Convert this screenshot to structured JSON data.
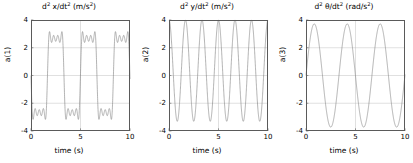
{
  "figure": {
    "background": "#ffffff",
    "line_color": "#808080",
    "grid_color": "#b9b9b9",
    "axis_color": "#5a5a5a"
  },
  "chart_data": [
    {
      "type": "line",
      "index": 0,
      "title": "d² x/dt² (m/s²)",
      "title_parts": {
        "d": "d",
        "sup1": "2",
        "mid": " x/dt",
        "sup2": "2",
        "units": " (m/s",
        "sup3": "2",
        "close": ")"
      },
      "xlabel": "time (s)",
      "ylabel": "a(1)",
      "xlim": [
        0,
        10
      ],
      "ylim": [
        -4,
        4
      ],
      "xticks": [
        0,
        5,
        10
      ],
      "xticklabels": [
        "0",
        "5",
        "10"
      ],
      "yticks": [
        -4,
        -2,
        0,
        2,
        4
      ],
      "yticklabels": [
        "-4",
        "-2",
        "0",
        "2",
        "4"
      ],
      "grid": true,
      "gridlines_y": [
        -2,
        0,
        2
      ],
      "gridlines_x": [
        5
      ],
      "legend": null,
      "waveform": "square_with_ripple",
      "description": "Square-wave-like acceleration with three ripple humps on each plateau",
      "fundamental_period_s": 3.33,
      "plateau_level": 2.75,
      "ripple_peak": 3.4,
      "harmonics": [
        {
          "n": 1,
          "amplitude": 3.4
        },
        {
          "n": 3,
          "amplitude": 1.1333
        },
        {
          "n": 5,
          "amplitude": 0.68
        },
        {
          "n": 7,
          "amplitude": 0.4857
        }
      ],
      "phase_rad": 0.0,
      "start_value": -2.1
    },
    {
      "type": "line",
      "index": 1,
      "title": "d² y/dt² (m/s²)",
      "title_parts": {
        "d": "d",
        "sup1": "2",
        "mid": " y/dt",
        "sup2": "2",
        "units": " (m/s",
        "sup3": "2",
        "close": ")"
      },
      "xlabel": "time (s)",
      "ylabel": "a(2)",
      "xlim": [
        0,
        10
      ],
      "ylim": [
        -4,
        4
      ],
      "xticks": [
        0,
        5,
        10
      ],
      "xticklabels": [
        "0",
        "5",
        "10"
      ],
      "yticks": [
        -4,
        -2,
        0,
        2,
        4
      ],
      "yticklabels": [
        "-4",
        "-2",
        "0",
        "2",
        "4"
      ],
      "grid": true,
      "gridlines_y": [
        -2,
        0,
        2
      ],
      "gridlines_x": [
        5
      ],
      "legend": null,
      "waveform": "sinusoid",
      "description": "Sinusoidal acceleration, about six cycles over ten seconds, offset upward",
      "period_s": 1.667,
      "amplitude": 3.65,
      "offset": 0.35,
      "peak": 4.0,
      "trough": -3.3,
      "phase_rad": 1.5708,
      "start_value": 3.9
    },
    {
      "type": "line",
      "index": 2,
      "title": "d² θ/dt² (rad/s²)",
      "title_parts": {
        "d": "d",
        "sup1": "2",
        "mid": " θ/dt",
        "sup2": "2",
        "units": " (rad/s",
        "sup3": "2",
        "close": ")"
      },
      "xlabel": "time (s)",
      "ylabel": "a(3)",
      "xlim": [
        0,
        10
      ],
      "ylim": [
        -4,
        4
      ],
      "xticks": [
        0,
        5,
        10
      ],
      "xticklabels": [
        "0",
        "5",
        "10"
      ],
      "yticks": [
        -4,
        -2,
        0,
        2,
        4
      ],
      "yticklabels": [
        "-4",
        "-2",
        "0",
        "2",
        "4"
      ],
      "grid": true,
      "gridlines_y": [
        -2,
        0,
        2
      ],
      "gridlines_x": [
        5
      ],
      "legend": null,
      "waveform": "sinusoid",
      "description": "Clean sinusoidal angular acceleration, three cycles over ten seconds",
      "period_s": 3.33,
      "amplitude": 3.72,
      "offset": 0.0,
      "peak": 3.72,
      "trough": -3.72,
      "phase_rad": 0.0,
      "start_value": 0.0
    }
  ]
}
